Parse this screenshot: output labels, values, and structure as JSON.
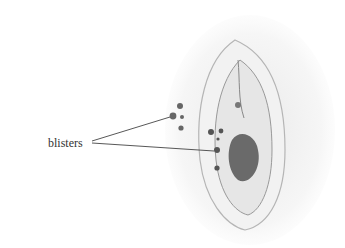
{
  "figure": {
    "type": "medical illustration",
    "annotations": [
      {
        "label": "blisters",
        "pointer_count": 2
      }
    ]
  }
}
